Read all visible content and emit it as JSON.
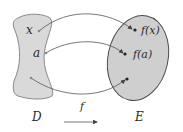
{
  "diagram": {
    "type": "function-mapping",
    "domain_set": {
      "label": "D",
      "fill": "#d9d9d9",
      "stroke": "#8a8a8a"
    },
    "codomain_set": {
      "label": "E",
      "fill": "#cfcfcf",
      "stroke": "#4a4a4a"
    },
    "function_label": "f",
    "points": [
      {
        "from_label": "x",
        "to_label": "f(x)"
      },
      {
        "from_label": "a",
        "to_label": "f(a)"
      },
      {
        "from_label": "",
        "to_label": ""
      }
    ]
  }
}
